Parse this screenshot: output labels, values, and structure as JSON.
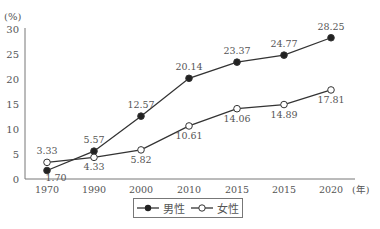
{
  "chart_data": {
    "type": "line",
    "title": "",
    "ylabel": "(%)",
    "xlabel": "(年)",
    "categories": [
      "1970",
      "1990",
      "2000",
      "2010",
      "2015",
      "2015",
      "2020"
    ],
    "yticks": [
      0,
      5,
      10,
      15,
      20,
      25,
      30
    ],
    "ylim": [
      0,
      30
    ],
    "grid": false,
    "legend_position": "bottom-center",
    "series": [
      {
        "name": "男性",
        "marker": "filled-circle",
        "values": [
          1.7,
          5.57,
          12.57,
          20.14,
          23.37,
          24.77,
          28.25
        ],
        "labels": [
          "1.70",
          "5.57",
          "12.57",
          "20.14",
          "23.37",
          "24.77",
          "28.25"
        ]
      },
      {
        "name": "女性",
        "marker": "open-circle",
        "values": [
          3.33,
          4.33,
          5.82,
          10.61,
          14.06,
          14.89,
          17.81
        ],
        "labels": [
          "3.33",
          "4.33",
          "5.82",
          "10.61",
          "14.06",
          "14.89",
          "17.81"
        ]
      }
    ]
  },
  "legend": {
    "male": "男性",
    "female": "女性"
  },
  "colors": {
    "line": "#333333",
    "axis": "#777777",
    "text": "#555555"
  }
}
